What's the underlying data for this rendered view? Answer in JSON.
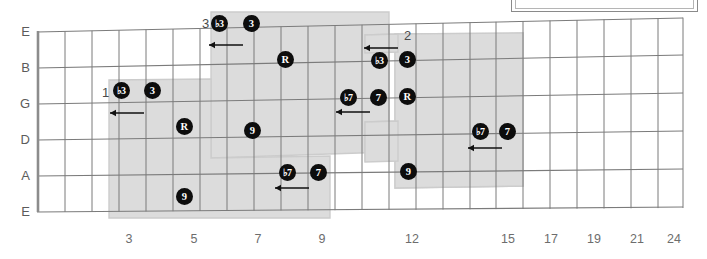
{
  "diagram": {
    "type": "guitar-fretboard",
    "title_box_present": true,
    "strings": [
      "E",
      "B",
      "G",
      "D",
      "A",
      "E"
    ],
    "fret_numbers": [
      {
        "label": "3",
        "x": 129
      },
      {
        "label": "5",
        "x": 194
      },
      {
        "label": "7",
        "x": 258
      },
      {
        "label": "9",
        "x": 322
      },
      {
        "label": "12",
        "x": 412
      },
      {
        "label": "15",
        "x": 508
      },
      {
        "label": "17",
        "x": 551
      },
      {
        "label": "19",
        "x": 594
      },
      {
        "label": "21",
        "x": 637
      },
      {
        "label": "24",
        "x": 674
      }
    ],
    "region_labels": [
      {
        "label": "1",
        "x": 102,
        "y": 86
      },
      {
        "label": "2",
        "x": 404,
        "y": 29
      },
      {
        "label": "3",
        "x": 202,
        "y": 17
      },
      {
        "label": "4",
        "x": 0,
        "y": 0
      }
    ],
    "markers": [
      {
        "degree": "♭3",
        "x": 121,
        "y": 90,
        "string": "G",
        "fret": 3
      },
      {
        "degree": "3",
        "x": 152,
        "y": 90,
        "string": "G",
        "fret": 4
      },
      {
        "degree": "R",
        "x": 184,
        "y": 126,
        "string": "D",
        "fret": 5
      },
      {
        "degree": "9",
        "x": 184,
        "y": 196,
        "string": "E",
        "fret": 5
      },
      {
        "degree": "♭3",
        "x": 219,
        "y": 23,
        "string": "E",
        "fret": 6
      },
      {
        "degree": "3",
        "x": 251,
        "y": 23,
        "string": "E",
        "fret": 7
      },
      {
        "degree": "R",
        "x": 285,
        "y": 59,
        "string": "B",
        "fret": 8
      },
      {
        "degree": "9",
        "x": 252,
        "y": 130,
        "string": "D",
        "fret": 7
      },
      {
        "degree": "♭7",
        "x": 287,
        "y": 172,
        "string": "A",
        "fret": 8
      },
      {
        "degree": "7",
        "x": 318,
        "y": 172,
        "string": "A",
        "fret": 9
      },
      {
        "degree": "♭7",
        "x": 348,
        "y": 97,
        "string": "G",
        "fret": 10
      },
      {
        "degree": "7",
        "x": 378,
        "y": 97,
        "string": "G",
        "fret": 11
      },
      {
        "degree": "R",
        "x": 407,
        "y": 96,
        "string": "G",
        "fret": 12
      },
      {
        "degree": "♭3",
        "x": 379,
        "y": 60,
        "string": "B",
        "fret": 11
      },
      {
        "degree": "3",
        "x": 407,
        "y": 59,
        "string": "B",
        "fret": 12
      },
      {
        "degree": "9",
        "x": 408,
        "y": 171,
        "string": "A",
        "fret": 12
      },
      {
        "degree": "♭7",
        "x": 480,
        "y": 131,
        "string": "D",
        "fret": 15
      },
      {
        "degree": "7",
        "x": 507,
        "y": 131,
        "string": "D",
        "fret": 16
      }
    ],
    "arrows": [
      {
        "x": 122,
        "y": 113,
        "width": 34
      },
      {
        "x": 221,
        "y": 45,
        "width": 34
      },
      {
        "x": 287,
        "y": 188,
        "width": 34
      },
      {
        "x": 348,
        "y": 112,
        "width": 34
      },
      {
        "x": 376,
        "y": 48,
        "width": 34
      },
      {
        "x": 480,
        "y": 148,
        "width": 34
      }
    ],
    "colors": {
      "shade": "#dcdcdc",
      "shade_border": "#c8c8c8",
      "grid": "#7b7b7b",
      "nut": "#8a8a8a",
      "marker_fill": "#0d0d0d",
      "marker_text": "#ffffff",
      "label_text": "#5b5b5b",
      "fret_num_text": "#6d6d6d",
      "background": "#ffffff"
    }
  }
}
